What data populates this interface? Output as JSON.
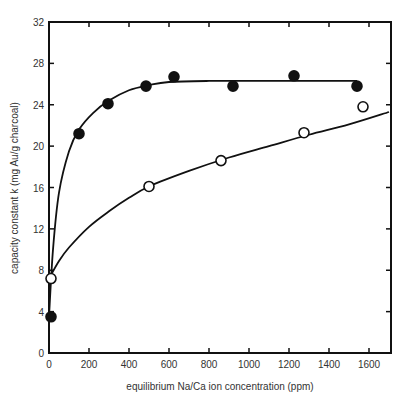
{
  "chart_data": {
    "type": "scatter",
    "title": "",
    "xlabel": "equilibrium Na/Ca ion concentration (ppm)",
    "ylabel": "capacity constant k (mg Au/g charcoal)",
    "xlim": [
      0,
      1700
    ],
    "ylim": [
      0,
      32
    ],
    "x_ticks": [
      0,
      200,
      400,
      600,
      800,
      1000,
      1200,
      1400,
      1600
    ],
    "y_ticks": [
      0,
      4,
      8,
      12,
      16,
      20,
      24,
      28,
      32
    ],
    "grid": false,
    "legend": "none",
    "series": [
      {
        "name": "filled circles",
        "marker": "filled-circle",
        "points": [
          {
            "x": 0,
            "y": 3.5
          },
          {
            "x": 150,
            "y": 21.2
          },
          {
            "x": 295,
            "y": 24.1
          },
          {
            "x": 485,
            "y": 25.8
          },
          {
            "x": 625,
            "y": 26.7
          },
          {
            "x": 920,
            "y": 25.8
          },
          {
            "x": 1225,
            "y": 26.8
          },
          {
            "x": 1540,
            "y": 25.8
          }
        ],
        "fit_curve": [
          [
            0,
            3.5
          ],
          [
            20,
            10
          ],
          [
            50,
            15.5
          ],
          [
            100,
            19.5
          ],
          [
            150,
            21.6
          ],
          [
            220,
            23.2
          ],
          [
            300,
            24.4
          ],
          [
            400,
            25.4
          ],
          [
            500,
            25.9
          ],
          [
            600,
            26.2
          ],
          [
            800,
            26.3
          ],
          [
            1000,
            26.3
          ],
          [
            1540,
            26.3
          ]
        ]
      },
      {
        "name": "open circles",
        "marker": "open-circle",
        "points": [
          {
            "x": 0,
            "y": 7.2
          },
          {
            "x": 500,
            "y": 16.1
          },
          {
            "x": 860,
            "y": 18.6
          },
          {
            "x": 1275,
            "y": 21.3
          },
          {
            "x": 1570,
            "y": 23.8
          }
        ],
        "fit_curve": [
          [
            0,
            7.2
          ],
          [
            50,
            8.9
          ],
          [
            100,
            10.2
          ],
          [
            200,
            12.2
          ],
          [
            300,
            13.7
          ],
          [
            400,
            15.0
          ],
          [
            500,
            16.1
          ],
          [
            700,
            17.6
          ],
          [
            900,
            18.9
          ],
          [
            1100,
            20.0
          ],
          [
            1300,
            21.1
          ],
          [
            1500,
            22.1
          ],
          [
            1700,
            23.3
          ]
        ]
      }
    ]
  },
  "labels": {
    "xlabel": "equilibrium Na/Ca ion concentration (ppm)",
    "ylabel": "capacity constant k (mg Au/g charcoal)"
  }
}
